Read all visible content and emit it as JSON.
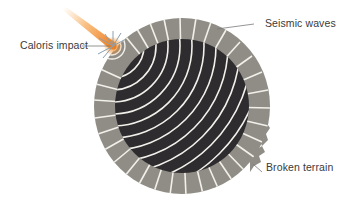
{
  "diagram": {
    "labels": {
      "caloris_impact": "Caloris impact",
      "seismic_waves": "Seismic waves",
      "broken_terrain": "Broken terrain"
    },
    "colors": {
      "background": "#ffffff",
      "outer_ring": "#8f8d85",
      "inner_core": "#2f2c2f",
      "wave_lines": "#f2f0ea",
      "impact_orange": "#f08a28",
      "leader_line": "#7a7a7a",
      "label_text": "#3a3a3a"
    }
  }
}
